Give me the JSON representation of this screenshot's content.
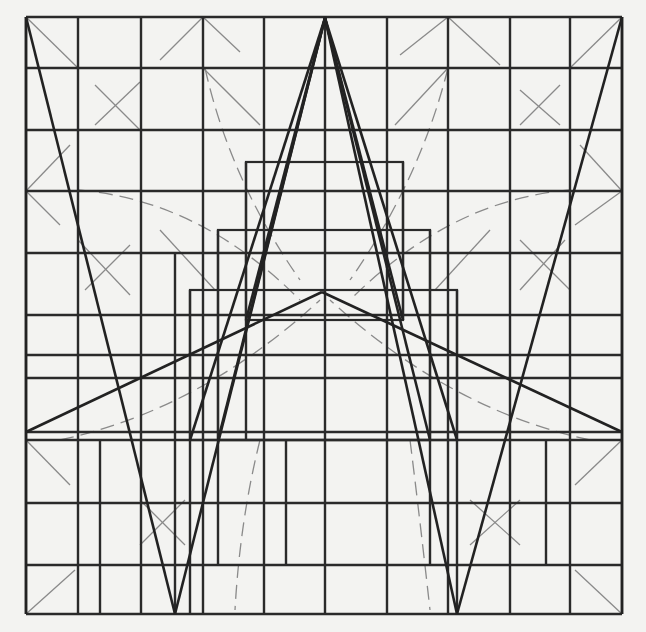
{
  "figure": {
    "colors": {
      "ink": "#2a2a2a",
      "light_ink": "#8a8a8a",
      "paper": "#f3f3f1"
    },
    "frame": {
      "x1": 26,
      "y1": 17,
      "x2": 622,
      "y2": 614
    },
    "apex": {
      "x": 325,
      "y": 18
    },
    "inner_apex": {
      "x": 322,
      "y": 292
    },
    "grid_x": [
      26,
      78,
      141,
      203,
      264,
      325,
      387,
      448,
      510,
      570,
      622
    ],
    "grid_y": [
      17,
      68,
      130,
      191,
      253,
      315,
      355,
      378,
      432,
      440,
      503,
      565,
      614
    ],
    "extra_verticals": [
      {
        "x": 100,
        "y1": 440,
        "y2": 614
      },
      {
        "x": 175,
        "y1": 253,
        "y2": 614
      },
      {
        "x": 190,
        "y1": 290,
        "y2": 614
      },
      {
        "x": 218,
        "y1": 230,
        "y2": 565
      },
      {
        "x": 246,
        "y1": 162,
        "y2": 440
      },
      {
        "x": 286,
        "y1": 440,
        "y2": 565
      },
      {
        "x": 403,
        "y1": 162,
        "y2": 320
      },
      {
        "x": 430,
        "y1": 230,
        "y2": 565
      },
      {
        "x": 457,
        "y1": 290,
        "y2": 614
      },
      {
        "x": 546,
        "y1": 440,
        "y2": 565
      }
    ],
    "boxes": [
      {
        "x": 246,
        "y": 162,
        "w": 157,
        "h": 158
      },
      {
        "x": 218,
        "y": 230,
        "w": 212,
        "h": 210
      },
      {
        "x": 190,
        "y": 290,
        "w": 267,
        "h": 150
      }
    ],
    "bold_lines": [
      [
        26,
        17,
        175,
        614
      ],
      [
        622,
        17,
        457,
        614
      ],
      [
        325,
        18,
        175,
        614
      ],
      [
        325,
        18,
        457,
        614
      ],
      [
        325,
        18,
        218,
        440
      ],
      [
        325,
        18,
        430,
        440
      ],
      [
        325,
        18,
        246,
        320
      ],
      [
        325,
        18,
        403,
        320
      ],
      [
        325,
        18,
        190,
        440
      ],
      [
        325,
        18,
        457,
        440
      ],
      [
        322,
        292,
        26,
        432
      ],
      [
        322,
        292,
        622,
        432
      ],
      [
        26,
        17,
        26,
        614
      ],
      [
        622,
        17,
        622,
        614
      ]
    ],
    "thin_lines": [
      [
        26,
        17,
        78,
        68
      ],
      [
        203,
        17,
        160,
        60
      ],
      [
        203,
        17,
        240,
        52
      ],
      [
        448,
        17,
        400,
        55
      ],
      [
        448,
        17,
        500,
        65
      ],
      [
        622,
        17,
        570,
        68
      ],
      [
        95,
        85,
        140,
        130
      ],
      [
        140,
        82,
        95,
        125
      ],
      [
        520,
        90,
        560,
        125
      ],
      [
        560,
        85,
        520,
        125
      ],
      [
        26,
        191,
        70,
        145
      ],
      [
        26,
        191,
        60,
        225
      ],
      [
        622,
        191,
        575,
        225
      ],
      [
        622,
        191,
        580,
        145
      ],
      [
        78,
        240,
        130,
        295
      ],
      [
        130,
        245,
        85,
        290
      ],
      [
        520,
        240,
        570,
        290
      ],
      [
        565,
        240,
        520,
        290
      ],
      [
        26,
        440,
        70,
        485
      ],
      [
        26,
        614,
        75,
        570
      ],
      [
        622,
        440,
        575,
        485
      ],
      [
        622,
        614,
        575,
        570
      ],
      [
        140,
        500,
        185,
        545
      ],
      [
        185,
        500,
        140,
        545
      ],
      [
        470,
        500,
        520,
        545
      ],
      [
        520,
        500,
        470,
        545
      ],
      [
        203,
        68,
        260,
        125
      ],
      [
        448,
        68,
        395,
        125
      ],
      [
        160,
        230,
        215,
        290
      ],
      [
        490,
        230,
        435,
        290
      ],
      [
        325,
        80,
        325,
        600
      ]
    ],
    "dashed_curves": [
      "M 205 68 Q 230 180 300 280",
      "M 448 68 Q 420 180 350 280",
      "M 78 190 Q 200 200 300 300",
      "M 570 190 Q 450 200 350 300",
      "M 60 440 Q 200 410 320 300",
      "M 590 440 Q 450 410 330 300",
      "M 260 440 Q 240 520 235 610",
      "M 410 440 Q 420 520 430 610"
    ]
  }
}
